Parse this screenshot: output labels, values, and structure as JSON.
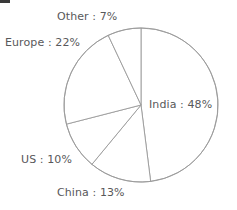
{
  "chart_data": {
    "type": "pie",
    "title": "",
    "categories": [
      "India",
      "China",
      "US",
      "Europe",
      "Other"
    ],
    "values": [
      48,
      13,
      10,
      22,
      7
    ],
    "unit": "%",
    "start_angle_deg": 0,
    "direction": "clockwise",
    "legend_position": "none",
    "labels_position": "outside",
    "grid": false,
    "colors": {
      "slice_fill": "#ffffff",
      "slice_stroke": "#9a9a9a",
      "label_text": "#58585a",
      "background": "#ffffff"
    },
    "data_labels": [
      {
        "name": "India",
        "value": 48,
        "text": "India : 48%"
      },
      {
        "name": "China",
        "value": 13,
        "text": "China : 13%"
      },
      {
        "name": "US",
        "value": 10,
        "text": "US : 10%"
      },
      {
        "name": "Europe",
        "value": 22,
        "text": "Europe : 22%"
      },
      {
        "name": "Other",
        "value": 7,
        "text": "Other : 7%"
      }
    ]
  },
  "labels": {
    "other": "Other : 7%",
    "europe": "Europe : 22%",
    "india": "India : 48%",
    "us": "US : 10%",
    "china": "China : 13%"
  }
}
